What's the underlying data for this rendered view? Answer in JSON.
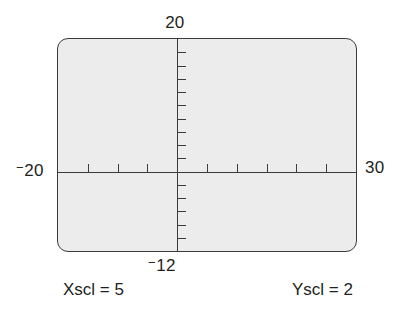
{
  "figure": {
    "kind": "graphing-calculator-window",
    "colors": {
      "screen_fill": "#ececed",
      "screen_border": "#3b3b3d",
      "axis": "#3b3b3d",
      "text": "#231f20",
      "page_background": "#ffffff"
    }
  },
  "labels": {
    "y_max": "20",
    "y_min_sign": "−",
    "y_min_value": "12",
    "x_min_sign": "−",
    "x_min_value": "20",
    "x_max": "30"
  },
  "captions": {
    "xscl": "Xscl = 5",
    "yscl": "Yscl = 2"
  },
  "chart_data": {
    "type": "line",
    "title": "",
    "subtitle": "",
    "xlabel": "",
    "ylabel": "",
    "grid": false,
    "legend": "none",
    "annotations": [
      "Xscl = 5",
      "Yscl = 2"
    ],
    "window": {
      "Xmin": -20,
      "Xmax": 30,
      "Xscl": 5,
      "Ymin": -12,
      "Ymax": 20,
      "Yscl": 2
    },
    "axis_ranges": {
      "x": [
        -20,
        30
      ],
      "y": [
        -12,
        20
      ]
    },
    "tick_labels": {
      "x": [
        "-20",
        "30"
      ],
      "y": [
        "-12",
        "20"
      ]
    },
    "x_ticks": [
      -15,
      -10,
      -5,
      5,
      10,
      15,
      20,
      25
    ],
    "y_ticks": [
      -10,
      -8,
      -6,
      -4,
      -2,
      2,
      4,
      6,
      8,
      10,
      12,
      14,
      16,
      18
    ],
    "series": [],
    "values": [],
    "categories": []
  }
}
